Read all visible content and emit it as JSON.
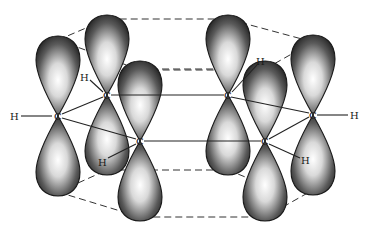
{
  "diagram": {
    "atoms": [
      {
        "id": "C1",
        "label": "C",
        "x": 58,
        "y": 116
      },
      {
        "id": "C2",
        "label": "C",
        "x": 107,
        "y": 95
      },
      {
        "id": "C3",
        "label": "C",
        "x": 140,
        "y": 141
      },
      {
        "id": "C4",
        "label": "C",
        "x": 228,
        "y": 95
      },
      {
        "id": "C5",
        "label": "C",
        "x": 265,
        "y": 141
      },
      {
        "id": "C6",
        "label": "C",
        "x": 313,
        "y": 115
      }
    ],
    "hydrogens": [
      {
        "id": "H1",
        "label": "H",
        "x": 15,
        "y": 116,
        "bonded_to": "C1"
      },
      {
        "id": "H2",
        "label": "H",
        "x": 85,
        "y": 77,
        "bonded_to": "C2"
      },
      {
        "id": "H3",
        "label": "H",
        "x": 103,
        "y": 162,
        "bonded_to": "C3"
      },
      {
        "id": "H4",
        "label": "H",
        "x": 261,
        "y": 61,
        "bonded_to": "C4"
      },
      {
        "id": "H5",
        "label": "H",
        "x": 305,
        "y": 160,
        "bonded_to": "C5"
      },
      {
        "id": "H6",
        "label": "H",
        "x": 354,
        "y": 115,
        "bonded_to": "C6"
      }
    ],
    "carbon_label": "C",
    "hydrogen_label": "H",
    "colors": {
      "background": "#ffffff",
      "line": "#222222",
      "lobe_dark": "#2a2a2a",
      "lobe_light": "#f4f4f4"
    }
  }
}
